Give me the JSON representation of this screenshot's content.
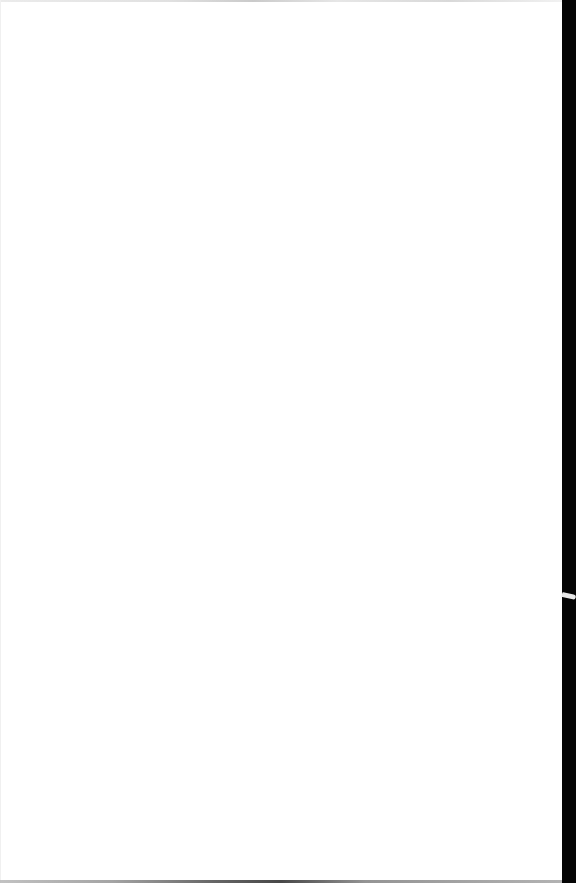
{
  "document": {
    "type": "scanned-page",
    "content": "",
    "page_color": "#ffffff",
    "edge_color": "#050505"
  }
}
